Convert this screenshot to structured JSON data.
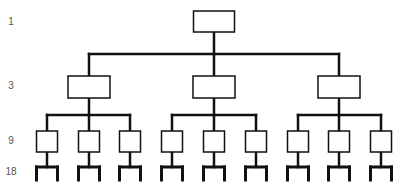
{
  "diagram": {
    "type": "organizational-hierarchy",
    "levels": [
      {
        "count_label": "1",
        "y": 22
      },
      {
        "count_label": "3",
        "y": 86
      },
      {
        "count_label": "9",
        "y": 141
      },
      {
        "count_label": "18",
        "y": 172
      }
    ],
    "nodes": {
      "level1": [
        {
          "cx": 214
        }
      ],
      "level3": [
        {
          "cx": 89
        },
        {
          "cx": 214
        },
        {
          "cx": 339
        }
      ],
      "level9": [
        {
          "cx": 47
        },
        {
          "cx": 89
        },
        {
          "cx": 130
        },
        {
          "cx": 172
        },
        {
          "cx": 214
        },
        {
          "cx": 256
        },
        {
          "cx": 298
        },
        {
          "cx": 339
        },
        {
          "cx": 381
        }
      ]
    },
    "colors": {
      "line": "#111111",
      "label": "#555555",
      "background": "#ffffff"
    }
  }
}
